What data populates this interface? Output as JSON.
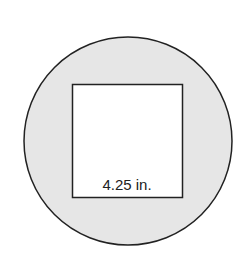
{
  "diagram": {
    "type": "square inscribed in circle",
    "circle": {
      "fill": "#e6e6e6",
      "stroke": "#222222"
    },
    "square": {
      "fill": "#ffffff",
      "stroke": "#222222"
    },
    "side_label": "4.25 in."
  }
}
